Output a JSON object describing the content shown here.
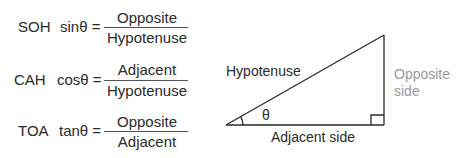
{
  "formulas": [
    {
      "mnemonic": "SOH",
      "function": "sinθ =",
      "numerator": "Opposite",
      "denominator": "Hypotenuse"
    },
    {
      "mnemonic": "CAH",
      "function": "cosθ =",
      "numerator": "Adjacent",
      "denominator": "Hypotenuse"
    },
    {
      "mnemonic": "TOA",
      "function": "tanθ =",
      "numerator": "Opposite",
      "denominator": "Adjacent"
    }
  ],
  "triangle": {
    "hypotenuse_label": "Hypotenuse",
    "opposite_label_line1": "Opposite",
    "opposite_label_line2": "side",
    "adjacent_label": "Adjacent side",
    "angle_label": "θ",
    "line_color": "#2a2a2a",
    "opposite_color": "#9a9a9a"
  }
}
